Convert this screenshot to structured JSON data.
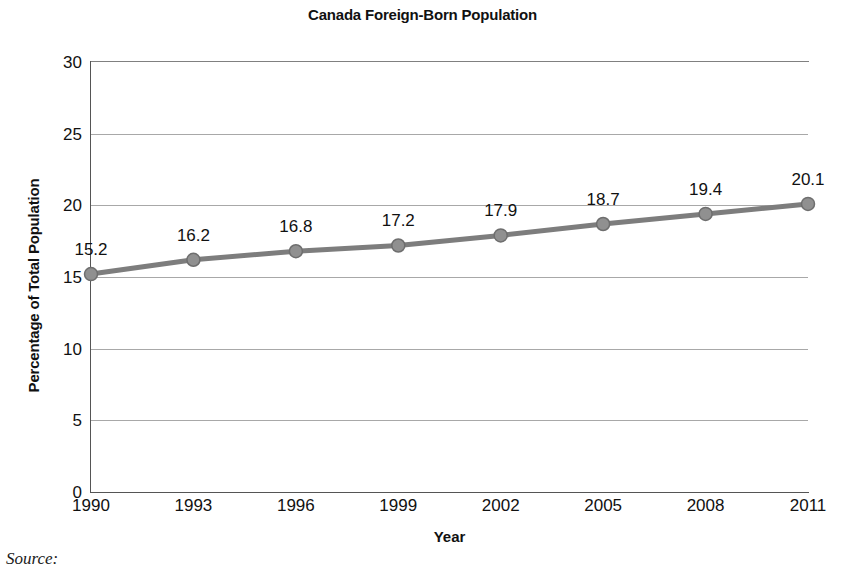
{
  "chart_data": {
    "type": "line",
    "title": "Canada Foreign-Born Population",
    "xlabel": "Year",
    "ylabel": "Percentage of Total Population",
    "categories": [
      "1990",
      "1993",
      "1996",
      "1999",
      "2002",
      "2005",
      "2008",
      "2011"
    ],
    "values": [
      15.2,
      16.2,
      16.8,
      17.2,
      17.9,
      18.7,
      19.4,
      20.1
    ],
    "point_labels": [
      "15.2",
      "16.2",
      "16.8",
      "17.2",
      "17.9",
      "18.7",
      "19.4",
      "20.1"
    ],
    "ylim": [
      0,
      30
    ],
    "ytick_labels": [
      "0",
      "5",
      "10",
      "15",
      "20",
      "25",
      "30"
    ],
    "ytick_values": [
      0,
      5,
      10,
      15,
      20,
      25,
      30
    ],
    "grid": true,
    "legend": false,
    "series_color": "#7d7d7d",
    "marker_color": "#909090",
    "marker_edge_color": "#6e6e6e",
    "gridline_color": "#a8a8a8",
    "axis_color": "#555555",
    "background_color": "#ffffff",
    "text_color": "#111111"
  },
  "source": {
    "label": "Source:"
  }
}
